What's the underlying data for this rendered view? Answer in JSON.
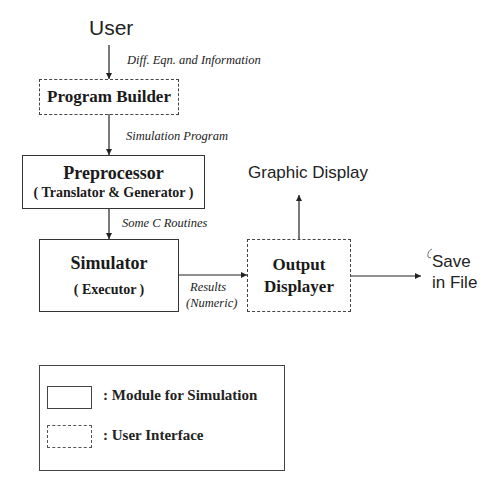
{
  "diagram": {
    "source_label": "User",
    "nodes": {
      "program_builder": {
        "title": "Program Builder",
        "style": "dashed"
      },
      "preprocessor": {
        "title": "Preprocessor",
        "subtitle": "( Translator & Generator )",
        "style": "solid"
      },
      "simulator": {
        "title": "Simulator",
        "subtitle": "( Executor )",
        "style": "solid"
      },
      "output_displayer": {
        "title_line1": "Output",
        "title_line2": "Displayer",
        "style": "dashed"
      }
    },
    "edges": {
      "user_to_builder": "Diff. Eqn. and Information",
      "builder_to_preprocessor": "Simulation Program",
      "preprocessor_to_simulator": "Some C Routines",
      "simulator_to_output_line1": "Results",
      "simulator_to_output_line2": "(Numeric)"
    },
    "outputs": {
      "graphic_display": "Graphic Display",
      "save_line1": "Save",
      "save_line2": "in File"
    },
    "legend": {
      "solid_label": ": Module for Simulation",
      "dashed_label": ": User Interface"
    }
  }
}
